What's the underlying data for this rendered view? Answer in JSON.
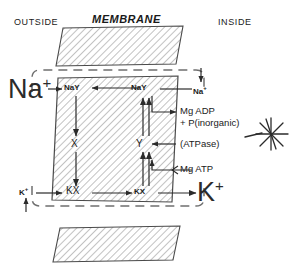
{
  "diagram": {
    "headers": {
      "outside": "OUTSIDE",
      "membrane": "MEMBRANE",
      "inside": "INSIDE"
    },
    "ions": {
      "sodium_outside": "Na",
      "sodium_outside_charge": "+",
      "sodium_inside": "Na",
      "sodium_inside_charge": "+",
      "potassium_outside": "K",
      "potassium_outside_charge": "+",
      "potassium_inside": "K",
      "potassium_inside_charge": "+"
    },
    "carriers": {
      "nay_left": "NaY",
      "nay_right": "NaY",
      "x": "X",
      "y": "Y",
      "kx_left": "KX",
      "kx_right": "KX"
    },
    "reactions": {
      "mg_adp": "Mg ADP",
      "phosphate": "+ P(inorganic)",
      "atpase": "(ATPase)",
      "mg_atp": "Mg ATP"
    },
    "icons": {
      "energy_burst": "starburst-icon"
    },
    "colors": {
      "ink": "#1a1a1a",
      "hatch": "#8a8a8a",
      "dashed": "#6f6f6f",
      "background": "#ffffff"
    }
  }
}
